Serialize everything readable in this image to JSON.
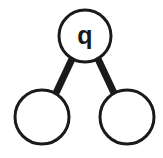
{
  "diagram": {
    "type": "binary-tree",
    "canvas": {
      "width": 163,
      "height": 158,
      "background": "#ffffff"
    },
    "style": {
      "node_fill": "#ffffff",
      "node_stroke": "#1a1a1a",
      "node_stroke_width": 3,
      "edge_stroke": "#1a1a1a",
      "edge_stroke_width": 7,
      "label_color": "#1a1a1a"
    },
    "nodes": [
      {
        "id": "root",
        "role": "root",
        "label": "q",
        "cx": 85,
        "cy": 36,
        "r": 26
      },
      {
        "id": "left-child",
        "role": "left-child",
        "label": "",
        "cx": 42,
        "cy": 117,
        "r": 27
      },
      {
        "id": "right-child",
        "role": "right-child",
        "label": "",
        "cx": 127,
        "cy": 117,
        "r": 27
      }
    ],
    "edges": [
      {
        "id": "edge-root-left",
        "from": "root",
        "to": "left-child",
        "x1": 72,
        "y1": 59,
        "x2": 56,
        "y2": 93
      },
      {
        "id": "edge-root-right",
        "from": "root",
        "to": "right-child",
        "x1": 98,
        "y1": 59,
        "x2": 114,
        "y2": 93
      }
    ]
  }
}
